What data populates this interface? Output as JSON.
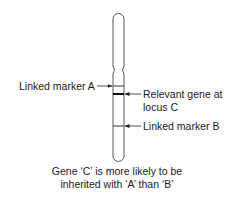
{
  "diagram": {
    "colors": {
      "outline": "#555555",
      "band": "#222222",
      "text": "#1a1a1a",
      "background": "#ffffff"
    },
    "chromosome": {
      "x_left": 113,
      "x_right": 124,
      "top": 13,
      "centromere_y": 70,
      "bottom": 161
    },
    "bands": [
      {
        "id": "A",
        "y": 86,
        "thickness": 1
      },
      {
        "id": "C",
        "y": 94,
        "thickness": 2
      },
      {
        "id": "B",
        "y": 126,
        "thickness": 1
      }
    ],
    "labels": {
      "marker_a": "Linked marker A",
      "gene_c_line1": "Relevant gene at",
      "gene_c_line2": "locus C",
      "marker_b": "Linked marker B"
    },
    "caption": {
      "line1": "Gene ‘C’ is more likely to be",
      "line2": "inherited with ‘A’ than ‘B’"
    }
  }
}
